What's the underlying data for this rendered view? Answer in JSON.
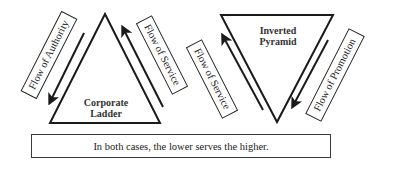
{
  "diagram": {
    "left": {
      "shape": "upright-triangle",
      "title_line1": "Corporate",
      "title_line2": "Ladder",
      "left_label": "Flow of Authority",
      "left_arrow_direction": "down",
      "right_label": "Flow of Service",
      "right_arrow_direction": "up"
    },
    "right": {
      "shape": "inverted-triangle",
      "title_line1": "Inverted",
      "title_line2": "Pyramid",
      "left_label": "Flow of Service",
      "left_arrow_direction": "up",
      "right_label": "Flow of Promotion",
      "right_arrow_direction": "down"
    },
    "caption": "In both cases, the lower serves the higher.",
    "colors": {
      "stroke": "#1a1a1a",
      "background": "#ffffff"
    }
  }
}
